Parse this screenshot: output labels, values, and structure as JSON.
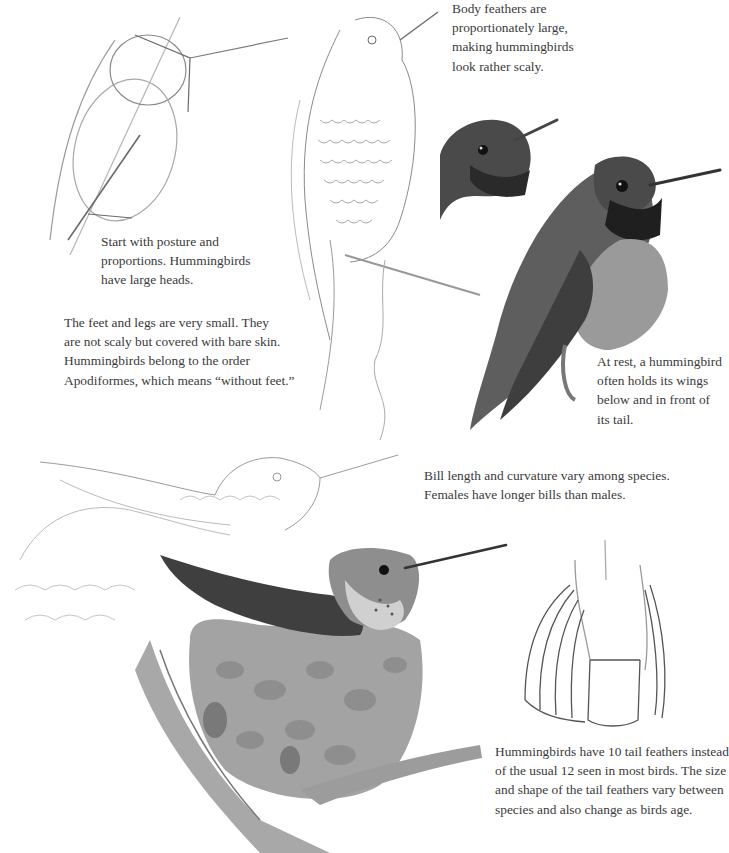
{
  "captions": {
    "body_feathers": "Body feathers are\nproportionately large,\nmaking hummingbirds\nlook rather scaly.",
    "posture": "Start with posture and\nproportions. Hummingbirds\nhave large heads.",
    "feet": "The feet and legs are very small. They\nare not scaly but covered with bare skin.\nHummingbirds belong to the order\nApodiformes, which means “without feet.”",
    "at_rest": "At rest, a hummingbird\noften holds its wings\nbelow and in front of\nits tail.",
    "bill": "Bill length and curvature vary among species.\nFemales have longer bills than males.",
    "tail": "Hummingbirds have 10 tail feathers instead\nof the usual 12 seen in most birds. The size\nand shape of the tail feathers vary between\nspecies and also change as birds age."
  },
  "colors": {
    "paper": "#ffffff",
    "text": "#3a3a3a",
    "pencil": "#8a8a8a",
    "dark_plumage": "#2e2e2e",
    "mid_plumage": "#6d6d6d",
    "nest": "#9a9a9a"
  }
}
